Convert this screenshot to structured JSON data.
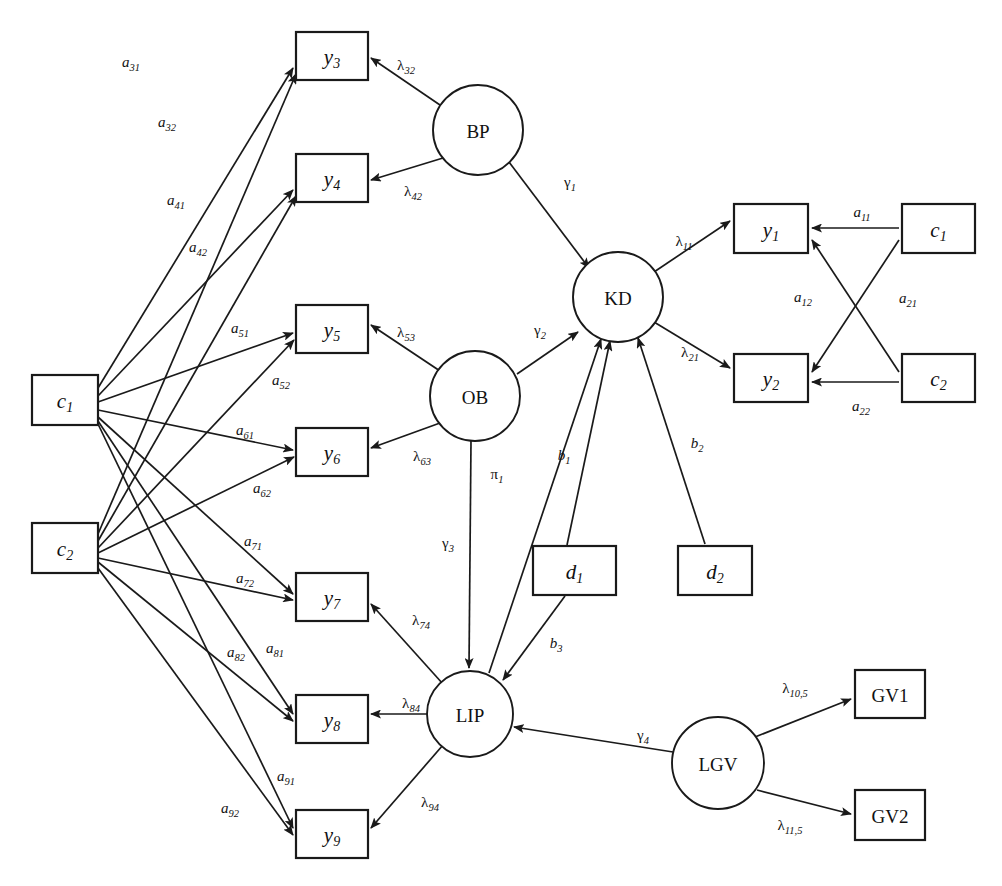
{
  "diagram": {
    "background_color": "#ffffff",
    "stroke_color": "#1a1a1a",
    "width": 1002,
    "height": 886
  },
  "nodes": {
    "observed_boxes": [
      {
        "id": "y3",
        "base": "y",
        "sub": "3",
        "italic": true,
        "x": 296,
        "y": 32,
        "w": 72,
        "h": 48
      },
      {
        "id": "y4",
        "base": "y",
        "sub": "4",
        "italic": true,
        "x": 296,
        "y": 154,
        "w": 72,
        "h": 48
      },
      {
        "id": "y5",
        "base": "y",
        "sub": "5",
        "italic": true,
        "x": 296,
        "y": 305,
        "w": 72,
        "h": 48
      },
      {
        "id": "y6",
        "base": "y",
        "sub": "6",
        "italic": true,
        "x": 296,
        "y": 428,
        "w": 72,
        "h": 48
      },
      {
        "id": "y7",
        "base": "y",
        "sub": "7",
        "italic": true,
        "x": 296,
        "y": 573,
        "w": 72,
        "h": 48
      },
      {
        "id": "y8",
        "base": "y",
        "sub": "8",
        "italic": true,
        "x": 296,
        "y": 695,
        "w": 72,
        "h": 48
      },
      {
        "id": "y9",
        "base": "y",
        "sub": "9",
        "italic": true,
        "x": 296,
        "y": 810,
        "w": 72,
        "h": 48
      },
      {
        "id": "y1",
        "base": "y",
        "sub": "1",
        "italic": true,
        "x": 734,
        "y": 204,
        "w": 74,
        "h": 49
      },
      {
        "id": "y2",
        "base": "y",
        "sub": "2",
        "italic": true,
        "x": 734,
        "y": 354,
        "w": 74,
        "h": 48
      },
      {
        "id": "c1left",
        "base": "c",
        "sub": "1",
        "italic": true,
        "x": 32,
        "y": 375,
        "w": 66,
        "h": 50
      },
      {
        "id": "c2left",
        "base": "c",
        "sub": "2",
        "italic": true,
        "x": 32,
        "y": 523,
        "w": 66,
        "h": 50
      },
      {
        "id": "c1right",
        "base": "c",
        "sub": "1",
        "italic": true,
        "x": 902,
        "y": 204,
        "w": 73,
        "h": 49
      },
      {
        "id": "c2right",
        "base": "c",
        "sub": "2",
        "italic": true,
        "x": 902,
        "y": 354,
        "w": 73,
        "h": 48
      },
      {
        "id": "d1",
        "base": "d",
        "sub": "1",
        "italic": true,
        "x": 533,
        "y": 546,
        "w": 83,
        "h": 49
      },
      {
        "id": "d2",
        "base": "d",
        "sub": "2",
        "italic": true,
        "x": 678,
        "y": 546,
        "w": 74,
        "h": 49
      },
      {
        "id": "GV1",
        "base": "GV1",
        "sub": "",
        "italic": false,
        "x": 855,
        "y": 670,
        "w": 70,
        "h": 48
      },
      {
        "id": "GV2",
        "base": "GV2",
        "sub": "",
        "italic": false,
        "x": 855,
        "y": 790,
        "w": 70,
        "h": 50
      }
    ],
    "latent_circles": [
      {
        "id": "BP",
        "label": "BP",
        "cx": 478,
        "cy": 130,
        "r": 45
      },
      {
        "id": "KD",
        "label": "KD",
        "cx": 618,
        "cy": 297,
        "r": 45
      },
      {
        "id": "OB",
        "label": "OB",
        "cx": 475,
        "cy": 396,
        "r": 45
      },
      {
        "id": "LIP",
        "label": "LIP",
        "cx": 470,
        "cy": 714,
        "r": 43
      },
      {
        "id": "LGV",
        "label": "LGV",
        "cx": 718,
        "cy": 763,
        "r": 46
      }
    ]
  },
  "edges": [
    {
      "id": "a31",
      "from": "c1left",
      "to": "y3",
      "base": "a",
      "sub": "31",
      "greek": false,
      "lx": 131,
      "ly": 62,
      "x1": 98,
      "y1": 388,
      "x2": 293,
      "y2": 68
    },
    {
      "id": "a32",
      "from": "c2left",
      "to": "y3",
      "base": "a",
      "sub": "32",
      "greek": false,
      "lx": 167,
      "ly": 122,
      "x1": 98,
      "y1": 534,
      "x2": 296,
      "y2": 74
    },
    {
      "id": "a41",
      "from": "c1left",
      "to": "y4",
      "base": "a",
      "sub": "41",
      "greek": false,
      "lx": 176,
      "ly": 200,
      "x1": 98,
      "y1": 396,
      "x2": 293,
      "y2": 190
    },
    {
      "id": "a42",
      "from": "c2left",
      "to": "y4",
      "base": "a",
      "sub": "42",
      "greek": false,
      "lx": 198,
      "ly": 247,
      "x1": 98,
      "y1": 541,
      "x2": 296,
      "y2": 196
    },
    {
      "id": "a51",
      "from": "c1left",
      "to": "y5",
      "base": "a",
      "sub": "51",
      "greek": false,
      "lx": 240,
      "ly": 328,
      "x1": 98,
      "y1": 402,
      "x2": 293,
      "y2": 333
    },
    {
      "id": "a52",
      "from": "c2left",
      "to": "y5",
      "base": "a",
      "sub": "52",
      "greek": false,
      "lx": 281,
      "ly": 380,
      "x1": 98,
      "y1": 548,
      "x2": 294,
      "y2": 340
    },
    {
      "id": "a61",
      "from": "c1left",
      "to": "y6",
      "base": "a",
      "sub": "61",
      "greek": false,
      "lx": 245,
      "ly": 430,
      "x1": 98,
      "y1": 410,
      "x2": 293,
      "y2": 450
    },
    {
      "id": "a62",
      "from": "c2left",
      "to": "y6",
      "base": "a",
      "sub": "62",
      "greek": false,
      "lx": 262,
      "ly": 488,
      "x1": 98,
      "y1": 553,
      "x2": 294,
      "y2": 457
    },
    {
      "id": "a71",
      "from": "c1left",
      "to": "y7",
      "base": "a",
      "sub": "71",
      "greek": false,
      "lx": 253,
      "ly": 541,
      "x1": 98,
      "y1": 417,
      "x2": 293,
      "y2": 594
    },
    {
      "id": "a72",
      "from": "c2left",
      "to": "y7",
      "base": "a",
      "sub": "72",
      "greek": false,
      "lx": 245,
      "ly": 578,
      "x1": 98,
      "y1": 558,
      "x2": 293,
      "y2": 600
    },
    {
      "id": "a81",
      "from": "c1left",
      "to": "y8",
      "base": "a",
      "sub": "81",
      "greek": false,
      "lx": 275,
      "ly": 648,
      "x1": 98,
      "y1": 421,
      "x2": 293,
      "y2": 714
    },
    {
      "id": "a82",
      "from": "c2left",
      "to": "y8",
      "base": "a",
      "sub": "82",
      "greek": false,
      "lx": 236,
      "ly": 652,
      "x1": 98,
      "y1": 562,
      "x2": 293,
      "y2": 721
    },
    {
      "id": "a91",
      "from": "c1left",
      "to": "y9",
      "base": "a",
      "sub": "91",
      "greek": false,
      "lx": 286,
      "ly": 776,
      "x1": 98,
      "y1": 424,
      "x2": 293,
      "y2": 828
    },
    {
      "id": "a92",
      "from": "c2left",
      "to": "y9",
      "base": "a",
      "sub": "92",
      "greek": false,
      "lx": 230,
      "ly": 808,
      "x1": 98,
      "y1": 568,
      "x2": 293,
      "y2": 835
    },
    {
      "id": "lam32",
      "from": "BP",
      "to": "y3",
      "base": "λ",
      "sub": "32",
      "greek": true,
      "lx": 406,
      "ly": 65,
      "x1": 440,
      "y1": 105,
      "x2": 371,
      "y2": 58
    },
    {
      "id": "lam42",
      "from": "BP",
      "to": "y4",
      "base": "λ",
      "sub": "42",
      "greek": true,
      "lx": 413,
      "ly": 191,
      "x1": 443,
      "y1": 158,
      "x2": 371,
      "y2": 180
    },
    {
      "id": "lam53",
      "from": "OB",
      "to": "y5",
      "base": "λ",
      "sub": "53",
      "greek": true,
      "lx": 406,
      "ly": 332,
      "x1": 440,
      "y1": 371,
      "x2": 371,
      "y2": 325
    },
    {
      "id": "lam63",
      "from": "OB",
      "to": "y6",
      "base": "λ",
      "sub": "63",
      "greek": true,
      "lx": 422,
      "ly": 456,
      "x1": 440,
      "y1": 423,
      "x2": 371,
      "y2": 448
    },
    {
      "id": "lam74",
      "from": "LIP",
      "to": "y7",
      "base": "λ",
      "sub": "74",
      "greek": true,
      "lx": 421,
      "ly": 620,
      "x1": 443,
      "y1": 684,
      "x2": 371,
      "y2": 604
    },
    {
      "id": "lam84",
      "from": "LIP",
      "to": "y8",
      "base": "λ",
      "sub": "84",
      "greek": true,
      "lx": 411,
      "ly": 703,
      "x1": 427,
      "y1": 714,
      "x2": 371,
      "y2": 714
    },
    {
      "id": "lam94",
      "from": "LIP",
      "to": "y9",
      "base": "λ",
      "sub": "94",
      "greek": true,
      "lx": 430,
      "ly": 802,
      "x1": 443,
      "y1": 745,
      "x2": 371,
      "y2": 828
    },
    {
      "id": "gam1",
      "from": "BP",
      "to": "KD",
      "base": "γ",
      "sub": "1",
      "greek": true,
      "lx": 570,
      "ly": 182,
      "x1": 509,
      "y1": 162,
      "x2": 589,
      "y2": 268
    },
    {
      "id": "gam2",
      "from": "OB",
      "to": "KD",
      "base": "γ",
      "sub": "2",
      "greek": true,
      "lx": 540,
      "ly": 330,
      "x1": 517,
      "y1": 374,
      "x2": 578,
      "y2": 332
    },
    {
      "id": "gam3",
      "from": "OB",
      "to": "LIP",
      "base": "γ",
      "sub": "3",
      "greek": true,
      "lx": 448,
      "ly": 543,
      "x1": 471,
      "y1": 441,
      "x2": 469,
      "y2": 668
    },
    {
      "id": "gam4",
      "from": "LGV",
      "to": "LIP",
      "base": "γ",
      "sub": "4",
      "greek": true,
      "lx": 643,
      "ly": 735,
      "x1": 673,
      "y1": 752,
      "x2": 514,
      "y2": 727
    },
    {
      "id": "lam11",
      "from": "KD",
      "to": "y1",
      "base": "λ",
      "sub": "11",
      "greek": true,
      "lx": 684,
      "ly": 241,
      "x1": 654,
      "y1": 272,
      "x2": 730,
      "y2": 221
    },
    {
      "id": "lam21",
      "from": "KD",
      "to": "y2",
      "base": "λ",
      "sub": "21",
      "greek": true,
      "lx": 690,
      "ly": 352,
      "x1": 654,
      "y1": 322,
      "x2": 730,
      "y2": 368
    },
    {
      "id": "a11",
      "from": "c1right",
      "to": "y1",
      "base": "a",
      "sub": "11",
      "greek": false,
      "lx": 862,
      "ly": 212,
      "x1": 899,
      "y1": 228,
      "x2": 812,
      "y2": 228
    },
    {
      "id": "a12",
      "from": "c2right",
      "to": "y1",
      "base": "a",
      "sub": "12",
      "greek": false,
      "lx": 803,
      "ly": 297,
      "x1": 899,
      "y1": 372,
      "x2": 812,
      "y2": 240
    },
    {
      "id": "a21",
      "from": "c1right",
      "to": "y2",
      "base": "a",
      "sub": "21",
      "greek": false,
      "lx": 908,
      "ly": 298,
      "x1": 899,
      "y1": 240,
      "x2": 812,
      "y2": 372
    },
    {
      "id": "a22",
      "from": "c2right",
      "to": "y2",
      "base": "a",
      "sub": "22",
      "greek": false,
      "lx": 861,
      "ly": 406,
      "x1": 899,
      "y1": 382,
      "x2": 812,
      "y2": 382
    },
    {
      "id": "pi1",
      "from": "LIP",
      "to": "KD",
      "base": "π",
      "sub": "1",
      "greek": true,
      "lx": 497,
      "ly": 474,
      "x1": 489,
      "y1": 673,
      "x2": 601,
      "y2": 339
    },
    {
      "id": "b1",
      "from": "d1",
      "to": "KD",
      "base": "b",
      "sub": "1",
      "greek": false,
      "lx": 564,
      "ly": 455,
      "x1": 567,
      "y1": 545,
      "x2": 610,
      "y2": 341
    },
    {
      "id": "b2",
      "from": "d2",
      "to": "KD",
      "base": "b",
      "sub": "2",
      "greek": false,
      "lx": 697,
      "ly": 443,
      "x1": 705,
      "y1": 544,
      "x2": 638,
      "y2": 338
    },
    {
      "id": "b3",
      "from": "d1",
      "to": "LIP",
      "base": "b",
      "sub": "3",
      "greek": false,
      "lx": 556,
      "ly": 643,
      "x1": 565,
      "y1": 596,
      "x2": 503,
      "y2": 680
    },
    {
      "id": "lam105",
      "from": "LGV",
      "to": "GV1",
      "base": "λ",
      "sub": "10,5",
      "greek": true,
      "lx": 795,
      "ly": 688,
      "x1": 755,
      "y1": 737,
      "x2": 851,
      "y2": 699
    },
    {
      "id": "lam115",
      "from": "LGV",
      "to": "GV2",
      "base": "λ",
      "sub": "11,5",
      "greek": true,
      "lx": 790,
      "ly": 825,
      "x1": 757,
      "y1": 790,
      "x2": 851,
      "y2": 814
    }
  ]
}
